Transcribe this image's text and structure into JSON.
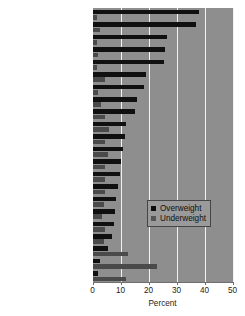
{
  "chart_data": {
    "type": "bar",
    "orientation": "horizontal",
    "title": "",
    "xlabel": "Percent",
    "ylabel": "",
    "xlim": [
      0,
      50
    ],
    "xticks": [
      0,
      10,
      20,
      30,
      40,
      50
    ],
    "grid": true,
    "legend_position": "center-right",
    "categories": [
      "Arab Rep. of Egypt",
      "Turkey",
      "Bolivia",
      "Nicaragua",
      "Colombia",
      "Cameroon",
      "Armenia",
      "Zimbabwe",
      "Morocco",
      "Haiti",
      "Kenya",
      "Ghana",
      "Uganda",
      "Kyrgyz Republic",
      "Benin",
      "Zambia",
      "Kazakhstan",
      "Mali",
      "Malawi",
      "Burkina Faso",
      "India",
      "Nepal"
    ],
    "series": [
      {
        "name": "Overweight",
        "color": "#101010",
        "values": [
          38.0,
          36.9,
          26.5,
          26.0,
          25.5,
          19.0,
          18.5,
          16.0,
          15.0,
          12.0,
          11.5,
          11.0,
          10.0,
          9.8,
          9.0,
          8.5,
          8.2,
          7.5,
          7.0,
          5.5,
          2.5,
          2.0
        ]
      },
      {
        "name": "Underweight",
        "color": "#4a4a4a",
        "values": [
          1.5,
          2.5,
          1.5,
          2.0,
          1.5,
          4.5,
          2.0,
          3.0,
          4.5,
          6.0,
          4.5,
          5.5,
          4.5,
          4.5,
          4.5,
          4.0,
          3.5,
          4.5,
          4.0,
          12.5,
          23.2,
          12.0
        ]
      }
    ]
  },
  "legend": {
    "items": [
      {
        "label": "Overweight"
      },
      {
        "label": "Underweight"
      }
    ]
  }
}
